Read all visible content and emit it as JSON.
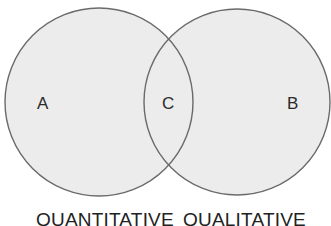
{
  "diagram": {
    "type": "venn",
    "colors": {
      "background": "#ffffff",
      "fill": "#ececec",
      "stroke": "#6a6a6a",
      "text": "#2a2a2a"
    },
    "circles": [
      {
        "id": "left",
        "cx": 99,
        "cy": 102,
        "r": 94
      },
      {
        "id": "right",
        "cx": 237,
        "cy": 102,
        "r": 93
      }
    ],
    "regions": {
      "a": "A",
      "c": "C",
      "b": "B"
    },
    "sets": {
      "left": "QUANTITATIVE",
      "right": "QUALITATIVE"
    }
  }
}
